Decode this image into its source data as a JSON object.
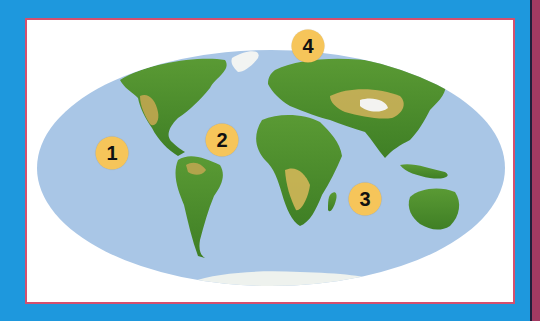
{
  "map": {
    "projection": "mollweide-world-physical",
    "colors": {
      "background": "#1e98dd",
      "frame_border": "#d4506e",
      "ocean": "#a9c6e6",
      "land_low": "#4f8f2c",
      "land_high": "#d9b85a",
      "ice": "#f2f4f2",
      "marker": "#f6c55a",
      "spine": "#a33a62"
    },
    "markers": [
      {
        "label": "1",
        "x": 112,
        "y": 153
      },
      {
        "label": "2",
        "x": 222,
        "y": 140
      },
      {
        "label": "3",
        "x": 365,
        "y": 199
      },
      {
        "label": "4",
        "x": 308,
        "y": 46
      }
    ]
  }
}
